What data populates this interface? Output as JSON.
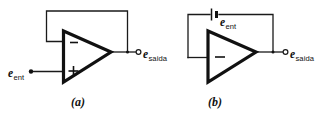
{
  "figure": {
    "kind": "circuit-diagram",
    "background_color": "#ffffff",
    "line_color": "#111111",
    "panels": [
      {
        "id": "a",
        "caption": "(a)",
        "amplifier": {
          "name": "op-amp",
          "inverting_input_sign": "−",
          "noninverting_input_sign": "+",
          "inverting_input_position": "top",
          "noninverting_input_position": "bottom"
        },
        "input_label": {
          "symbol": "e",
          "subscript": "ent"
        },
        "output_label": {
          "symbol": "e",
          "subscript": "saida"
        },
        "input_terminal": "filled-dot",
        "output_terminal": "open-circle",
        "feedback": "direct wire from output to inverting input"
      },
      {
        "id": "b",
        "caption": "(b)",
        "amplifier": {
          "name": "op-amp",
          "inverting_input_sign": "−",
          "noninverting_input_sign": "",
          "inverting_input_position": "middle",
          "noninverting_input_position": ""
        },
        "source_label": {
          "symbol": "e",
          "subscript": "ent"
        },
        "output_label": {
          "symbol": "e",
          "subscript": "saida"
        },
        "source_element": "battery",
        "output_terminal": "open-circle",
        "feedback": "output through battery back to inverting input"
      }
    ]
  }
}
